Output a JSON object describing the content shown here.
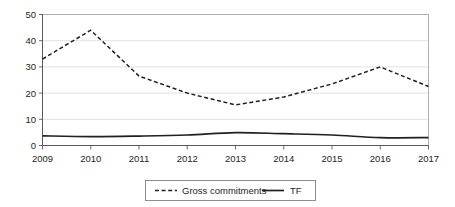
{
  "chart_data": {
    "type": "line",
    "title": "",
    "subtitle": "",
    "xlabel": "",
    "ylabel": "",
    "categories": [
      "2009",
      "2010",
      "2011",
      "2012",
      "2013",
      "2014",
      "2015",
      "2016",
      "2017"
    ],
    "x_tick_labels": [
      "2009",
      "2010",
      "2011",
      "2012",
      "2013",
      "2014",
      "2015",
      "2016",
      "2017"
    ],
    "y_tick_labels": [
      "0",
      "10",
      "20",
      "30",
      "40",
      "50"
    ],
    "y_ticks": [
      0,
      10,
      20,
      30,
      40,
      50
    ],
    "ylim": [
      0,
      50
    ],
    "xlim": [
      "2009",
      "2017"
    ],
    "grid": "horizontal",
    "legend_position": "bottom-center",
    "series": [
      {
        "name": "Gross commitments",
        "style": "dashed",
        "color": "#231f20",
        "values": [
          33,
          44,
          26.5,
          20,
          15.5,
          18.5,
          23.5,
          30,
          22.5
        ]
      },
      {
        "name": "TF",
        "style": "solid",
        "color": "#231f20",
        "values": [
          3.7,
          3.4,
          3.6,
          4.0,
          4.9,
          4.5,
          4.0,
          3.0,
          3.0
        ]
      }
    ]
  },
  "legend": {
    "items": [
      {
        "label": "Gross commitments",
        "marker": "dashed-line-swatch"
      },
      {
        "label": "TF",
        "marker": "solid-line-swatch"
      }
    ]
  },
  "colors": {
    "series": "#231f20",
    "grid": "#d9d9d9",
    "frame": "#a7a9ac",
    "axis": "#58595b",
    "background": "#ffffff"
  }
}
